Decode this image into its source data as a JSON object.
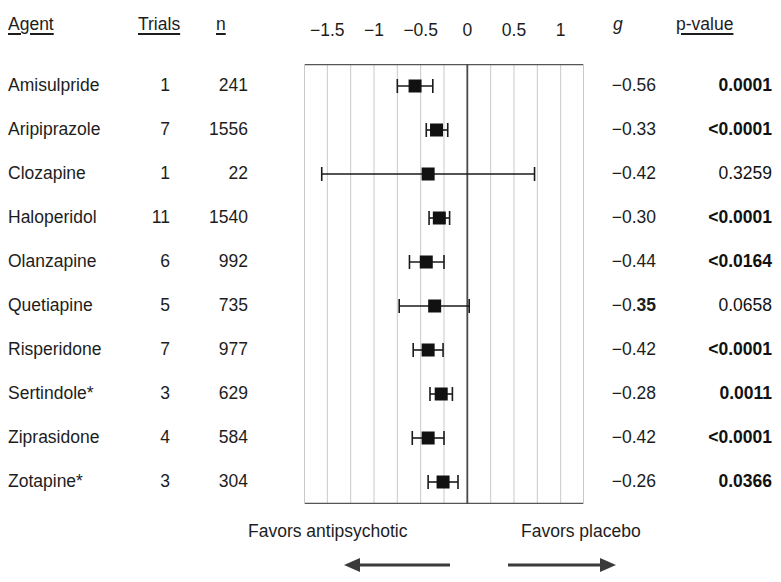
{
  "figure": {
    "type": "forest-plot",
    "columns": {
      "agent": "Agent",
      "trials": "Trials",
      "n": "n",
      "g": "g",
      "p": "p-value"
    },
    "footer": {
      "left_label": "Favors antipsychotic",
      "right_label": "Favors placebo"
    }
  },
  "chart_data": {
    "type": "scatter",
    "subtype": "forest-plot",
    "title": "",
    "xlabel": "",
    "ylabel": "",
    "xlim": [
      -1.75,
      1.25
    ],
    "xticks": [
      -1.5,
      -1,
      -0.5,
      0,
      0.5,
      1
    ],
    "xticklabels": [
      "−1.5",
      "−1",
      "−0.5",
      "0",
      "0.5",
      "1"
    ],
    "grid": true,
    "reference_line": 0,
    "effect_measure": "g",
    "legend": [],
    "annotations": [
      "Favors antipsychotic",
      "Favors placebo"
    ],
    "categories": [
      "Amisulpride",
      "Aripiprazole",
      "Clozapine",
      "Haloperidol",
      "Olanzapine",
      "Quetiapine",
      "Risperidone",
      "Sertindole*",
      "Ziprasidone",
      "Zotapine*"
    ],
    "values": [
      -0.56,
      -0.33,
      -0.42,
      -0.3,
      -0.44,
      -0.35,
      -0.42,
      -0.28,
      -0.42,
      -0.26
    ],
    "ci_low": [
      -0.75,
      -0.44,
      -1.56,
      -0.41,
      -0.62,
      -0.73,
      -0.58,
      -0.4,
      -0.59,
      -0.42
    ],
    "ci_high": [
      -0.37,
      -0.21,
      0.72,
      -0.19,
      -0.25,
      0.02,
      -0.26,
      -0.16,
      -0.25,
      -0.1
    ],
    "trials": [
      1,
      7,
      1,
      11,
      6,
      5,
      7,
      3,
      4,
      3
    ],
    "n": [
      241,
      1556,
      22,
      1540,
      992,
      735,
      977,
      629,
      584,
      304
    ],
    "p_values": [
      "0.0001",
      "<0.0001",
      "0.3259",
      "<0.0001",
      "<0.0164",
      "0.0658",
      "<0.0001",
      "0.0011",
      "<0.0001",
      "0.0366"
    ],
    "p_bold": [
      true,
      true,
      false,
      true,
      true,
      false,
      true,
      true,
      true,
      true
    ]
  },
  "rows": [
    {
      "agent": "Amisulpride",
      "trials": "1",
      "n": "241",
      "g": "−0.56",
      "g_prefix": "−0.56",
      "g_bold_suffix": "",
      "p": "0.0001",
      "p_bold": true
    },
    {
      "agent": "Aripiprazole",
      "trials": "7",
      "n": "1556",
      "g": "−0.33",
      "g_prefix": "−0.33",
      "g_bold_suffix": "",
      "p": "<0.0001",
      "p_bold": true
    },
    {
      "agent": "Clozapine",
      "trials": "1",
      "n": "22",
      "g": "−0.42",
      "g_prefix": "−0.42",
      "g_bold_suffix": "",
      "p": "0.3259",
      "p_bold": false
    },
    {
      "agent": "Haloperidol",
      "trials": "11",
      "n": "1540",
      "g": "−0.30",
      "g_prefix": "−0.30",
      "g_bold_suffix": "",
      "p": "<0.0001",
      "p_bold": true
    },
    {
      "agent": "Olanzapine",
      "trials": "6",
      "n": "992",
      "g": "−0.44",
      "g_prefix": "−0.44",
      "g_bold_suffix": "",
      "p": "<0.0164",
      "p_bold": true
    },
    {
      "agent": "Quetiapine",
      "trials": "5",
      "n": "735",
      "g": "−0.35",
      "g_prefix": "−0.",
      "g_bold_suffix": "35",
      "p": "0.0658",
      "p_bold": false
    },
    {
      "agent": "Risperidone",
      "trials": "7",
      "n": "977",
      "g": "−0.42",
      "g_prefix": "−0.42",
      "g_bold_suffix": "",
      "p": "<0.0001",
      "p_bold": true
    },
    {
      "agent": "Sertindole*",
      "trials": "3",
      "n": "629",
      "g": "−0.28",
      "g_prefix": "−0.28",
      "g_bold_suffix": "",
      "p": "0.0011",
      "p_bold": true
    },
    {
      "agent": "Ziprasidone",
      "trials": "4",
      "n": "584",
      "g": "−0.42",
      "g_prefix": "−0.42",
      "g_bold_suffix": "",
      "p": "<0.0001",
      "p_bold": true
    },
    {
      "agent": "Zotapine*",
      "trials": "3",
      "n": "304",
      "g": "−0.26",
      "g_prefix": "−0.26",
      "g_bold_suffix": "",
      "p": "0.0366",
      "p_bold": true
    }
  ],
  "style": {
    "marker_color": "#111111",
    "grid_color": "#c9c9c9",
    "axis_color": "#555555",
    "ref_line_color": "#4a4a4a",
    "text_color": "#1d1d1d"
  }
}
